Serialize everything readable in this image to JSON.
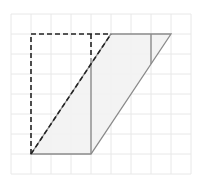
{
  "diagram": {
    "title": "",
    "type": "geometry-grid",
    "grid": {
      "origin_px": [
        11,
        14
      ],
      "cell_px": 20,
      "cols": 9,
      "rows": 8,
      "color": "#e8e8e8"
    },
    "colors": {
      "shade": "#f2f2f2",
      "solid_line": "#8a8a8a",
      "dashed_line": "#222222"
    },
    "shapes": {
      "parallelogram": {
        "label": "",
        "points": [
          [
            1,
            7
          ],
          [
            4,
            7
          ],
          [
            8,
            1
          ],
          [
            5,
            1
          ]
        ]
      },
      "dashed_rectangle_outline": {
        "label": "",
        "segments": [
          [
            [
              1,
              7
            ],
            [
              1,
              1
            ]
          ],
          [
            [
              1,
              1
            ],
            [
              5,
              1
            ]
          ],
          [
            [
              4,
              1
            ],
            [
              4,
              2.2
            ]
          ],
          [
            [
              1,
              7
            ],
            [
              5,
              1
            ]
          ]
        ]
      },
      "solid_verticals": [
        [
          [
            4,
            2.2
          ],
          [
            4,
            7
          ]
        ],
        [
          [
            7,
            1
          ],
          [
            7,
            2.5
          ]
        ]
      ]
    }
  }
}
